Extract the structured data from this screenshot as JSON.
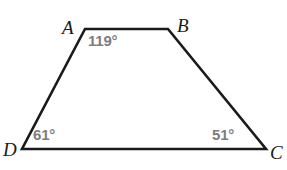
{
  "figure": {
    "type": "geometry-diagram",
    "shape_name": "quadrilateral-ABCD",
    "background_color": "#ffffff",
    "stroke_color": "#1a1a1a",
    "stroke_width": 2.6,
    "angle_label_color": "#7d7d7d",
    "vertex_label_color": "#1a1a1a",
    "canvas": {
      "width": 287,
      "height": 170
    }
  },
  "chart_data": {
    "type": "diagram",
    "title": "",
    "shape": "trapezoid",
    "vertices": [
      {
        "id": "A",
        "label": "A",
        "x": 85,
        "y": 29
      },
      {
        "id": "B",
        "label": "B",
        "x": 168,
        "y": 29
      },
      {
        "id": "C",
        "label": "C",
        "x": 266,
        "y": 149
      },
      {
        "id": "D",
        "label": "D",
        "x": 22,
        "y": 149
      }
    ],
    "edges": [
      {
        "from": "A",
        "to": "B"
      },
      {
        "from": "B",
        "to": "C"
      },
      {
        "from": "C",
        "to": "D"
      },
      {
        "from": "D",
        "to": "A"
      }
    ],
    "angles": [
      {
        "vertex": "A",
        "value": 119,
        "text": "119°",
        "shown": true
      },
      {
        "vertex": "B",
        "value": null,
        "text": "",
        "shown": false
      },
      {
        "vertex": "C",
        "value": 51,
        "text": "51°",
        "shown": true
      },
      {
        "vertex": "D",
        "value": 61,
        "text": "61°",
        "shown": true
      }
    ]
  },
  "labels": {
    "vertex_a": "A",
    "vertex_b": "B",
    "vertex_c": "C",
    "vertex_d": "D",
    "angle_a": "119°",
    "angle_c": "51°",
    "angle_d": "61°"
  }
}
